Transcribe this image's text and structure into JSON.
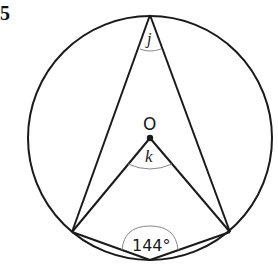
{
  "question_number": "5",
  "diagram": {
    "circle": {
      "center_label": "O"
    },
    "angles": {
      "j": {
        "label": "j",
        "at": "top vertex (inscribed angle)"
      },
      "k": {
        "label": "k",
        "at": "centre O"
      },
      "given": {
        "label": "144°",
        "at": "bottom vertex",
        "value_degrees": 144
      }
    },
    "colors": {
      "stroke": "#1a1a1a",
      "arc_marker": "#888888",
      "background": "#ffffff"
    }
  }
}
